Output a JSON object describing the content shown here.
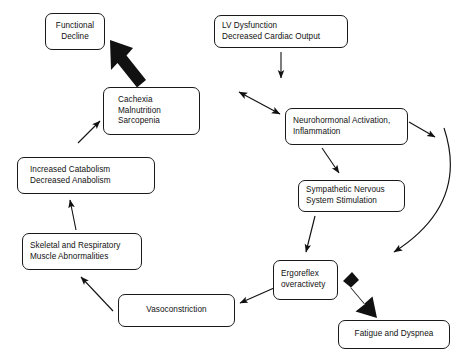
{
  "diagram": {
    "background_color": "#ffffff",
    "box_border_color": "#1a1a1a",
    "arrow_color": "#111111",
    "nodes": [
      {
        "id": "functional-decline",
        "lines": [
          "Functional",
          "Decline"
        ],
        "x": 45,
        "y": 13,
        "w": 60,
        "h": 37
      },
      {
        "id": "lv-dysfunction",
        "lines": [
          "LV Dysfunction",
          "Decreased Cardiac Output"
        ],
        "x": 214,
        "y": 15,
        "w": 134,
        "h": 33
      },
      {
        "id": "cachexia",
        "lines": [
          "Cachexia",
          "Malnutrition",
          "Sarcopenia"
        ],
        "x": 103,
        "y": 87,
        "w": 97,
        "h": 48
      },
      {
        "id": "neurohormonal-activation",
        "lines": [
          "Neurohormonal Activation,",
          "Inflammation"
        ],
        "x": 285,
        "y": 108,
        "w": 123,
        "h": 37
      },
      {
        "id": "increased-catabolism",
        "lines": [
          "Increased Catabolism",
          "Decreased Anabolism"
        ],
        "x": 17,
        "y": 157,
        "w": 138,
        "h": 37
      },
      {
        "id": "sympathetic-nervous",
        "lines": [
          "Sympathetic Nervous",
          "System Stimulation"
        ],
        "x": 298,
        "y": 180,
        "w": 107,
        "h": 32
      },
      {
        "id": "skeletal-respiratory",
        "lines": [
          "Skeletal and Respiratory",
          "Muscle Abnormalities"
        ],
        "x": 22,
        "y": 233,
        "w": 120,
        "h": 37
      },
      {
        "id": "ergoreflex",
        "lines": [
          "Ergoreflex",
          "overactivety"
        ],
        "x": 273,
        "y": 260,
        "w": 65,
        "h": 40
      },
      {
        "id": "vasoconstriction",
        "lines": [
          "Vasoconstriction"
        ],
        "x": 118,
        "y": 294,
        "w": 117,
        "h": 33
      },
      {
        "id": "fatigue-dyspnea",
        "lines": [
          "Fatigue and Dyspnea"
        ],
        "x": 338,
        "y": 320,
        "w": 112,
        "h": 29
      }
    ],
    "edges": [
      {
        "id": "cachexia-to-functional-decline",
        "style": "thick",
        "from": "cachexia",
        "to": "functional-decline"
      },
      {
        "id": "lv-to-neurohormonal",
        "style": "thin",
        "from": "lv-dysfunction",
        "to": "neurohormonal-activation"
      },
      {
        "id": "cachexia-neurohormonal-bidirectional",
        "style": "thin-double",
        "from": "cachexia",
        "to": "neurohormonal-activation"
      },
      {
        "id": "neurohormonal-to-sympathetic",
        "style": "thin",
        "from": "neurohormonal-activation",
        "to": "sympathetic-nervous"
      },
      {
        "id": "neurohormonal-curve-to-fatigue",
        "style": "thin-curved",
        "from": "neurohormonal-activation",
        "to": "fatigue-dyspnea"
      },
      {
        "id": "sympathetic-to-ergoreflex",
        "style": "thin",
        "from": "sympathetic-nervous",
        "to": "ergoreflex"
      },
      {
        "id": "ergoreflex-to-fatigue",
        "style": "thick",
        "from": "ergoreflex",
        "to": "fatigue-dyspnea"
      },
      {
        "id": "ergoreflex-to-vasoconstriction",
        "style": "thin",
        "from": "ergoreflex",
        "to": "vasoconstriction"
      },
      {
        "id": "vasoconstriction-to-skeletal",
        "style": "thin",
        "from": "vasoconstriction",
        "to": "skeletal-respiratory"
      },
      {
        "id": "skeletal-to-catabolism",
        "style": "thin",
        "from": "skeletal-respiratory",
        "to": "increased-catabolism"
      },
      {
        "id": "catabolism-to-cachexia",
        "style": "thin",
        "from": "increased-catabolism",
        "to": "cachexia"
      }
    ]
  }
}
